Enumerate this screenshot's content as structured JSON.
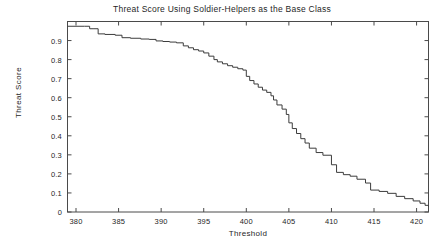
{
  "chart_data": {
    "type": "line",
    "subtype": "step",
    "title": "Threat Score Using Soldier-Helpers as the Base Class",
    "xlabel": "Threshold",
    "ylabel": "Threat Score",
    "xlim": [
      379,
      421.4
    ],
    "ylim": [
      0,
      1.0
    ],
    "xticks": [
      380,
      385,
      390,
      395,
      400,
      405,
      410,
      415,
      420
    ],
    "xtick_labels": [
      "380",
      "385",
      "390",
      "395",
      "400",
      "405",
      "410",
      "415",
      "420"
    ],
    "yticks": [
      0,
      0.1,
      0.2,
      0.3,
      0.4,
      0.5,
      0.6,
      0.7,
      0.8,
      0.9
    ],
    "ytick_labels": [
      "0",
      "0.1",
      "0.2",
      "0.3",
      "0.4",
      "0.5",
      "0.6",
      "0.7",
      "0.8",
      "0.9"
    ],
    "grid": false,
    "legend": false,
    "line_color": "#3c3c3c",
    "line_width": 1,
    "series": [
      {
        "name": "Threat Score",
        "x": [
          379.0,
          380.0,
          381.0,
          381.6,
          382.0,
          382.6,
          383.4,
          384.6,
          385.4,
          386.4,
          387.6,
          388.6,
          389.4,
          390.2,
          391.0,
          391.8,
          392.6,
          393.2,
          393.8,
          394.4,
          395.0,
          395.6,
          396.2,
          396.6,
          397.2,
          397.8,
          398.4,
          399.0,
          399.6,
          400.0,
          400.4,
          400.9,
          401.4,
          401.9,
          402.4,
          402.9,
          403.2,
          403.6,
          404.2,
          404.7,
          405.0,
          405.4,
          405.9,
          406.4,
          406.9,
          407.4,
          408.2,
          409.0,
          410.0,
          410.6,
          411.4,
          412.2,
          413.0,
          414.0,
          414.6,
          415.6,
          416.6,
          417.6,
          418.6,
          419.6,
          420.4,
          421.0,
          421.4
        ],
        "y": [
          0.975,
          0.975,
          0.975,
          0.962,
          0.962,
          0.935,
          0.932,
          0.928,
          0.915,
          0.912,
          0.908,
          0.906,
          0.898,
          0.895,
          0.892,
          0.888,
          0.872,
          0.862,
          0.852,
          0.845,
          0.835,
          0.818,
          0.8,
          0.788,
          0.778,
          0.768,
          0.76,
          0.752,
          0.745,
          0.712,
          0.69,
          0.672,
          0.655,
          0.64,
          0.628,
          0.61,
          0.588,
          0.562,
          0.54,
          0.512,
          0.468,
          0.438,
          0.412,
          0.385,
          0.362,
          0.335,
          0.312,
          0.298,
          0.248,
          0.208,
          0.196,
          0.188,
          0.172,
          0.152,
          0.115,
          0.108,
          0.098,
          0.082,
          0.07,
          0.058,
          0.046,
          0.035,
          0.028
        ]
      }
    ]
  },
  "axes": {
    "title_text": "Threat Score Using Soldier-Helpers as the Base Class",
    "x_axis_title": "Threshold",
    "y_axis_title": "Threat Score"
  }
}
